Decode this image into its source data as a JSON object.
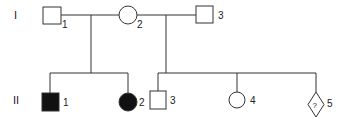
{
  "diagram": {
    "type": "pedigree",
    "colors": {
      "line": "#333333",
      "affected_fill": "#111111",
      "unaffected_fill": "#ffffff",
      "background": "#ffffff"
    },
    "generations": [
      {
        "label": "I",
        "individuals": [
          {
            "id": "1",
            "sex": "male",
            "affected": false
          },
          {
            "id": "2",
            "sex": "female",
            "affected": false
          },
          {
            "id": "3",
            "sex": "male",
            "affected": false
          }
        ]
      },
      {
        "label": "II",
        "individuals": [
          {
            "id": "1",
            "sex": "male",
            "affected": true,
            "parents": [
              "I-1",
              "I-2"
            ]
          },
          {
            "id": "2",
            "sex": "female",
            "affected": true,
            "parents": [
              "I-1",
              "I-2"
            ]
          },
          {
            "id": "3",
            "sex": "male",
            "affected": false,
            "parents": [
              "I-2",
              "I-3"
            ]
          },
          {
            "id": "4",
            "sex": "female",
            "affected": false,
            "parents": [
              "I-2",
              "I-3"
            ]
          },
          {
            "id": "5",
            "sex": "unknown",
            "affected": false,
            "parents": [
              "I-2",
              "I-3"
            ],
            "symbol_text": "?"
          }
        ]
      }
    ]
  }
}
